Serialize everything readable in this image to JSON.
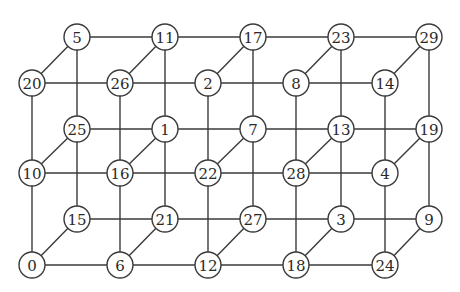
{
  "diagram": {
    "node_radius": 13,
    "colors": {
      "stroke": "#3a3a3a",
      "fill": "#ffffff",
      "text": "#2a2a2a"
    },
    "layers": {
      "front": {
        "x": [
          32,
          120,
          208,
          296,
          385
        ],
        "y": [
          83,
          173,
          265
        ]
      },
      "back": {
        "x": [
          77,
          165,
          253,
          341,
          429
        ],
        "y": [
          37,
          129,
          219
        ]
      }
    },
    "grid": {
      "back_top": [
        "5",
        "11",
        "17",
        "23",
        "29"
      ],
      "front_top": [
        "20",
        "26",
        "2",
        "8",
        "14"
      ],
      "back_middle": [
        "25",
        "1",
        "7",
        "13",
        "19"
      ],
      "front_middle": [
        "10",
        "16",
        "22",
        "28",
        "4"
      ],
      "back_bottom": [
        "15",
        "21",
        "27",
        "3",
        "9"
      ],
      "front_bottom": [
        "0",
        "6",
        "12",
        "18",
        "24"
      ]
    }
  }
}
